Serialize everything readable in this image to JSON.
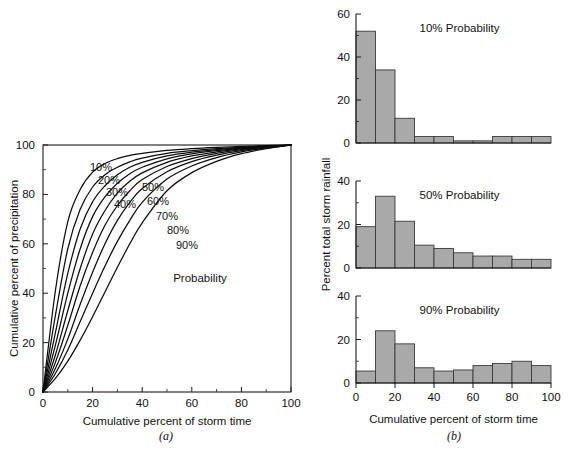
{
  "figure": {
    "panel_a_caption": "(a)",
    "panel_b_caption": "(b)"
  },
  "chart_data": [
    {
      "id": "cumulative-mass-curves",
      "type": "line",
      "title": "",
      "xlabel": "Cumulative percent of storm time",
      "ylabel": "Cumulative percent of precipitation",
      "xlim": [
        0,
        100
      ],
      "ylim": [
        0,
        100
      ],
      "xticks": [
        0,
        20,
        40,
        60,
        80,
        100
      ],
      "yticks": [
        0,
        20,
        40,
        60,
        80,
        100
      ],
      "xminorticks": [
        10,
        30,
        50,
        70,
        90
      ],
      "yminorticks": [
        10,
        30,
        50,
        70,
        90
      ],
      "grid": false,
      "legend_position": "inline-labels",
      "annotation": "Probability",
      "x": [
        0,
        5,
        10,
        15,
        20,
        25,
        30,
        35,
        40,
        50,
        60,
        70,
        80,
        90,
        100
      ],
      "series": [
        {
          "name": "10%",
          "label": "10%",
          "values": [
            0,
            41,
            69,
            82,
            89,
            92.5,
            94.5,
            95.8,
            96.6,
            97.8,
            98.5,
            99.0,
            99.4,
            99.7,
            100
          ]
        },
        {
          "name": "20%",
          "label": "20%",
          "values": [
            0,
            31,
            58,
            74,
            83,
            88,
            91,
            93.2,
            94.7,
            96.6,
            97.7,
            98.5,
            99.1,
            99.6,
            100
          ]
        },
        {
          "name": "30%",
          "label": "30%",
          "values": [
            0,
            24,
            48,
            66,
            77,
            83.5,
            88,
            91,
            93,
            95.6,
            97.1,
            98.1,
            98.9,
            99.5,
            100
          ]
        },
        {
          "name": "40%",
          "label": "40%",
          "values": [
            0,
            19,
            40,
            58,
            71,
            79,
            84.5,
            88.4,
            91,
            94.4,
            96.4,
            97.7,
            98.7,
            99.4,
            100
          ]
        },
        {
          "name": "50%",
          "label": "50%",
          "values": [
            0,
            15,
            33,
            50,
            64,
            73.5,
            80.5,
            85.3,
            88.7,
            93.0,
            95.6,
            97.2,
            98.4,
            99.3,
            100
          ]
        },
        {
          "name": "60%",
          "label": "60%",
          "values": [
            0,
            12,
            27,
            43,
            56.5,
            67.5,
            75.5,
            81.5,
            86,
            91.3,
            94.5,
            96.6,
            98.1,
            99.1,
            100
          ]
        },
        {
          "name": "70%",
          "label": "70%",
          "values": [
            0,
            9.5,
            21.5,
            35.5,
            48.5,
            60,
            69.5,
            76.8,
            82.4,
            89.2,
            93.3,
            95.9,
            97.7,
            99.0,
            100
          ]
        },
        {
          "name": "80%",
          "label": "80%",
          "values": [
            0,
            7.5,
            17,
            28.5,
            40,
            51,
            61,
            69.5,
            76.8,
            86.2,
            91.5,
            94.9,
            97.2,
            98.8,
            100
          ]
        },
        {
          "name": "90%",
          "label": "90%",
          "values": [
            0,
            5.5,
            12.5,
            21,
            30.5,
            40.5,
            50.5,
            60,
            68.5,
            81.5,
            88.8,
            93.4,
            96.5,
            98.5,
            100
          ]
        }
      ]
    },
    {
      "id": "hist-10-probability",
      "type": "bar",
      "title": "10% Probability",
      "xlabel": "",
      "ylabel": "",
      "xlim": [
        0,
        100
      ],
      "ylim": [
        0,
        60
      ],
      "yticks": [
        0,
        20,
        40,
        60
      ],
      "yminorticks": [
        10,
        30,
        50
      ],
      "xticks": [
        0,
        20,
        40,
        60,
        80,
        100
      ],
      "show_xticklabels": false,
      "categories": [
        "0-10",
        "10-20",
        "20-30",
        "30-40",
        "40-50",
        "50-60",
        "60-70",
        "70-80",
        "80-90",
        "90-100"
      ],
      "bin_edges": [
        0,
        10,
        20,
        30,
        40,
        50,
        60,
        70,
        80,
        90,
        100
      ],
      "values": [
        52,
        34,
        11.5,
        3,
        3,
        1,
        1,
        3,
        3,
        3
      ]
    },
    {
      "id": "hist-50-probability",
      "type": "bar",
      "title": "50% Probability",
      "xlabel": "",
      "ylabel": "Percent total storm rainfall",
      "xlim": [
        0,
        100
      ],
      "ylim": [
        0,
        40
      ],
      "yticks": [
        0,
        20,
        40
      ],
      "yminorticks": [
        10,
        30
      ],
      "xticks": [
        0,
        20,
        40,
        60,
        80,
        100
      ],
      "show_xticklabels": false,
      "categories": [
        "0-10",
        "10-20",
        "20-30",
        "30-40",
        "40-50",
        "50-60",
        "60-70",
        "70-80",
        "80-90",
        "90-100"
      ],
      "bin_edges": [
        0,
        10,
        20,
        30,
        40,
        50,
        60,
        70,
        80,
        90,
        100
      ],
      "values": [
        19,
        33,
        21.5,
        10.5,
        9,
        7,
        5.5,
        5.5,
        4,
        4
      ]
    },
    {
      "id": "hist-90-probability",
      "type": "bar",
      "title": "90% Probability",
      "xlabel": "Cumulative percent of storm time",
      "ylabel": "",
      "xlim": [
        0,
        100
      ],
      "ylim": [
        0,
        40
      ],
      "yticks": [
        0,
        20,
        40
      ],
      "yminorticks": [
        10,
        30
      ],
      "xticks": [
        0,
        20,
        40,
        60,
        80,
        100
      ],
      "show_xticklabels": true,
      "categories": [
        "0-10",
        "10-20",
        "20-30",
        "30-40",
        "40-50",
        "50-60",
        "60-70",
        "70-80",
        "80-90",
        "90-100"
      ],
      "bin_edges": [
        0,
        10,
        20,
        30,
        40,
        50,
        60,
        70,
        80,
        90,
        100
      ],
      "values": [
        5.5,
        24,
        18,
        7,
        5.5,
        6,
        8,
        9,
        10,
        8
      ]
    }
  ],
  "colors": {
    "bar_fill": "#a9a9a9",
    "bar_stroke": "#3a3a3a",
    "curve": "#0d0d0d",
    "axis": "#1a1a1a",
    "text": "#111111",
    "background": "#ffffff"
  }
}
